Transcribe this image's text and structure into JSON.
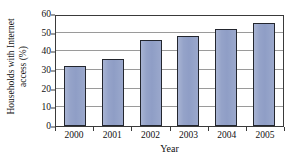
{
  "chart_data": {
    "type": "bar",
    "title": "",
    "xlabel": "Year",
    "ylabel": "Households with Internet access (%)",
    "ylabel_lines": [
      "Households with Internet",
      "access (%)"
    ],
    "categories": [
      "2000",
      "2001",
      "2002",
      "2003",
      "2004",
      "2005"
    ],
    "values": [
      32,
      36,
      46,
      48,
      52,
      55
    ],
    "series": [
      {
        "name": "Households with Internet access (%)",
        "values": [
          32,
          36,
          46,
          48,
          52,
          55
        ]
      }
    ],
    "ylim": [
      0,
      60
    ],
    "yticks": [
      0,
      10,
      20,
      30,
      40,
      50,
      60
    ],
    "ytick_labels": [
      "0",
      "10",
      "20",
      "30",
      "40",
      "50",
      "60"
    ],
    "grid": true,
    "grid_axis": "y",
    "legend": false,
    "legend_position": "none",
    "bar_color": "#8f9ec6",
    "bar_edge_color": "#23262e",
    "grid_color": "#9a9a9a",
    "axis_color": "#3a3a3a",
    "background_color": "#ffffff"
  }
}
